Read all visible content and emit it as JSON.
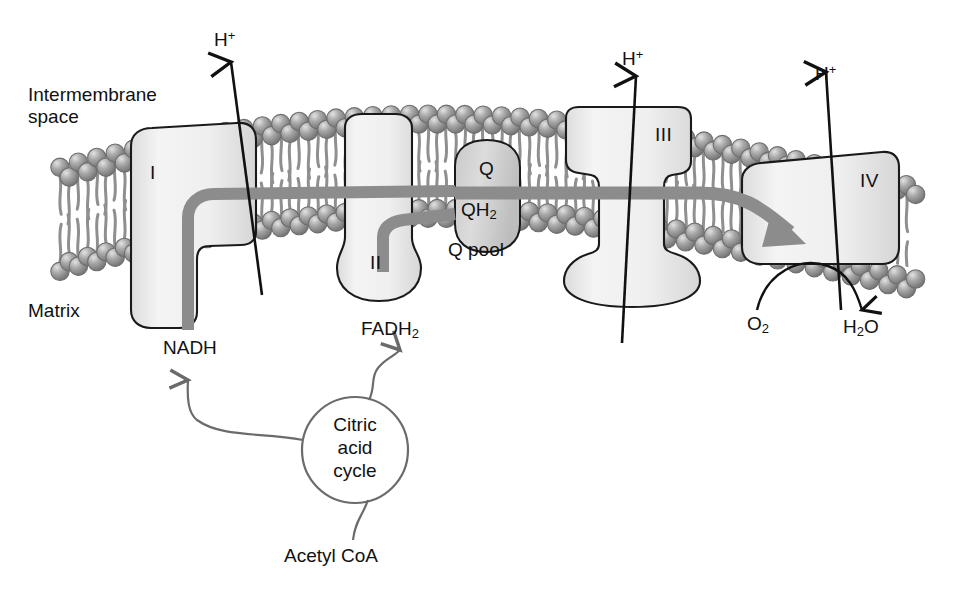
{
  "figure": {
    "type": "biology-diagram"
  },
  "regions": {
    "intermembrane_space": "Intermembrane\nspace",
    "matrix": "Matrix"
  },
  "complexes": [
    {
      "id": "I",
      "label": "I",
      "name": "complex-i"
    },
    {
      "id": "II",
      "label": "II",
      "name": "complex-ii"
    },
    {
      "id": "III",
      "label": "III",
      "name": "complex-iii"
    },
    {
      "id": "IV",
      "label": "IV",
      "name": "complex-iv"
    }
  ],
  "q_pool": {
    "oxidized": "Q",
    "reduced_prefix": "QH",
    "reduced_sub": "2",
    "pool_label": "Q pool"
  },
  "proton_arrows": [
    {
      "label": "H",
      "charge": "+",
      "source": "complex-i"
    },
    {
      "label": "H",
      "charge": "+",
      "source": "complex-iii"
    },
    {
      "label": "H",
      "charge": "+",
      "source": "complex-iv"
    }
  ],
  "donors": {
    "nadh": "NADH",
    "fadh2_prefix": "FADH",
    "fadh2_sub": "2"
  },
  "terminal_reaction": {
    "substrate_prefix": "O",
    "substrate_sub": "2",
    "product_prefix": "H",
    "product_sub": "2",
    "product_suffix": "O"
  },
  "cycle": {
    "line1": "Citric",
    "line2": "acid",
    "line3": "cycle",
    "input": "Acetyl CoA"
  },
  "colors": {
    "ink": "#111111",
    "membrane_head": "#9a9a9a",
    "membrane_head_dark": "#6e6e6e",
    "membrane_tail": "#8f8f8f",
    "complex_fill": "#f0f0f0",
    "complex_stroke": "#1a1a1a",
    "electron_band": "#8c8c8c",
    "qpool_fill": "#d5d5d5",
    "curve_gray": "#6b6b6b",
    "background": "#ffffff"
  }
}
